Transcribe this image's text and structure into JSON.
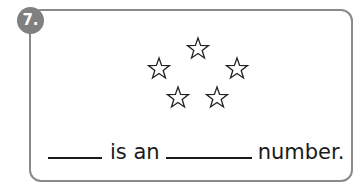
{
  "question": {
    "number_label": "7.",
    "badge_color": "#808080",
    "border_color": "#8a8a8a",
    "star_count": 5,
    "sentence": {
      "part1": "is an",
      "part2": "number."
    }
  }
}
